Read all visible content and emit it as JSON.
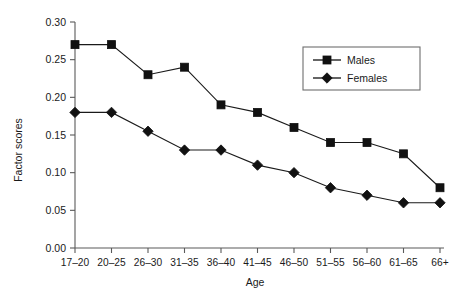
{
  "chart_data": {
    "type": "line",
    "title": "",
    "xlabel": "Age",
    "ylabel": "Factor scores",
    "categories": [
      "17–20",
      "20–25",
      "26–30",
      "31–35",
      "36–40",
      "41–45",
      "46–50",
      "51–55",
      "56–60",
      "61–65",
      "66+"
    ],
    "series": [
      {
        "name": "Males",
        "marker": "square",
        "color": "#111111",
        "values": [
          0.27,
          0.27,
          0.23,
          0.24,
          0.19,
          0.18,
          0.16,
          0.14,
          0.14,
          0.125,
          0.08
        ]
      },
      {
        "name": "Females",
        "marker": "diamond",
        "color": "#111111",
        "values": [
          0.18,
          0.18,
          0.155,
          0.13,
          0.13,
          0.11,
          0.1,
          0.08,
          0.07,
          0.06,
          0.06
        ]
      }
    ],
    "ylim": [
      0.0,
      0.3
    ],
    "yticks": [
      0.0,
      0.05,
      0.1,
      0.15,
      0.2,
      0.25,
      0.3
    ],
    "ytick_labels": [
      "0.00",
      "0.05",
      "0.10",
      "0.15",
      "0.20",
      "0.25",
      "0.30"
    ],
    "grid": false,
    "legend_position": "upper-right"
  },
  "legend": {
    "entries": [
      {
        "label": "Males"
      },
      {
        "label": "Females"
      }
    ]
  },
  "axes": {
    "x_title": "Age",
    "y_title": "Factor scores"
  }
}
